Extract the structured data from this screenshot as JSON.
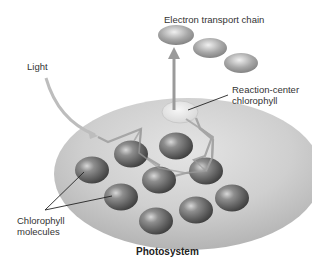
{
  "diagram": {
    "title": "Photosystem",
    "labels": {
      "electron_transport_chain": "Electron transport chain",
      "light": "Light",
      "reaction_center_line1": "Reaction-center",
      "reaction_center_line2": "chlorophyll",
      "chlorophyll_line1": "Chlorophyll",
      "chlorophyll_line2": "molecules"
    },
    "colors": {
      "disk": "#c8c8c8",
      "sphere": "#6e6e6e",
      "path": "#a8a8a8",
      "reaction_center": "#e6e6e6",
      "etc": "#9a9a9a"
    },
    "chlorophyll_molecule_count": 9,
    "electron_transport_carriers": 3
  }
}
